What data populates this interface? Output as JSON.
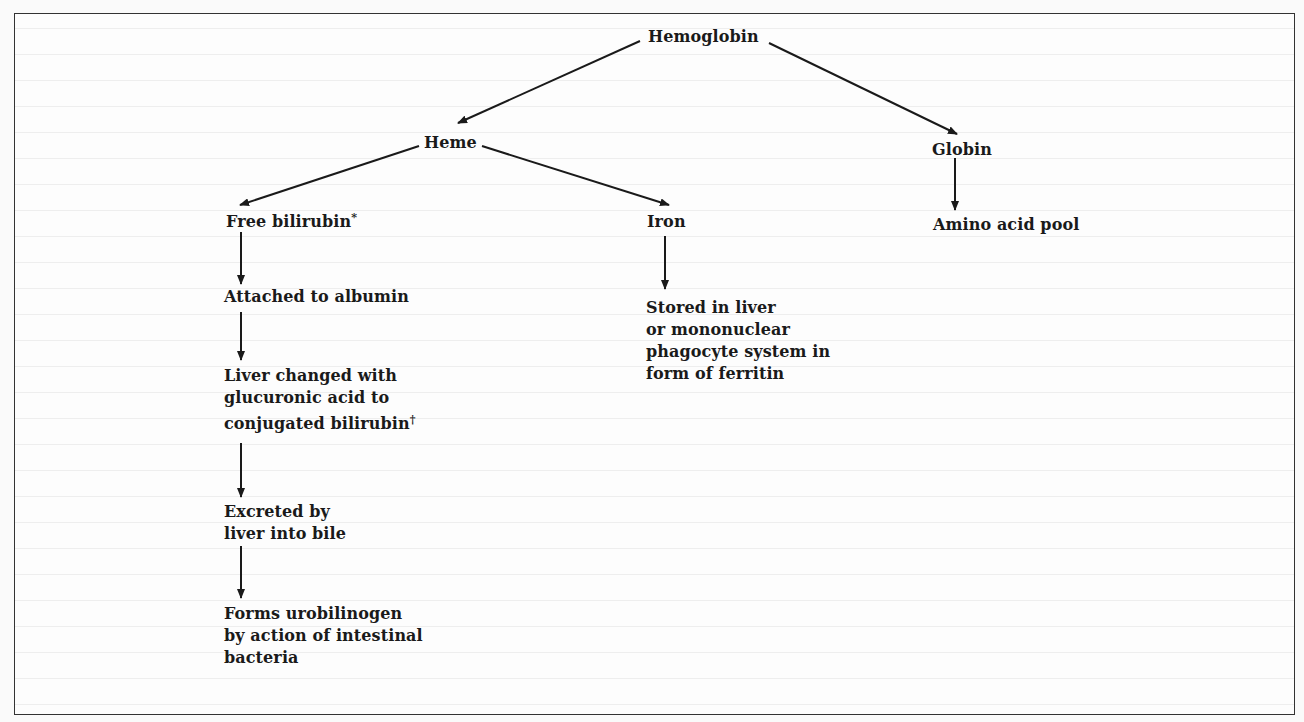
{
  "diagram": {
    "type": "flowchart",
    "nodes": {
      "hemoglobin": "Hemoglobin",
      "heme": "Heme",
      "globin": "Globin",
      "free_bilirubin": "Free bilirubin",
      "free_bilirubin_mark": "*",
      "iron": "Iron",
      "amino_acid_pool": "Amino acid pool",
      "attached_albumin": "Attached to albumin",
      "liver_changed": [
        "Liver changed with",
        "glucuronic acid to",
        "conjugated bilirubin"
      ],
      "liver_changed_mark": "†",
      "stored_liver": [
        "Stored in liver",
        "or mononuclear",
        "phagocyte system in",
        "form of ferritin"
      ],
      "excreted": [
        "Excreted by",
        "liver into bile"
      ],
      "urobilinogen": [
        "Forms urobilinogen",
        "by action of intestinal",
        "bacteria"
      ]
    },
    "edges": [
      [
        "Hemoglobin",
        "Heme"
      ],
      [
        "Hemoglobin",
        "Globin"
      ],
      [
        "Heme",
        "Free bilirubin"
      ],
      [
        "Heme",
        "Iron"
      ],
      [
        "Globin",
        "Amino acid pool"
      ],
      [
        "Free bilirubin",
        "Attached to albumin"
      ],
      [
        "Attached to albumin",
        "Liver changed with glucuronic acid to conjugated bilirubin"
      ],
      [
        "Liver changed with glucuronic acid to conjugated bilirubin",
        "Excreted by liver into bile"
      ],
      [
        "Excreted by liver into bile",
        "Forms urobilinogen by action of intestinal bacteria"
      ],
      [
        "Iron",
        "Stored in liver or mononuclear phagocyte system in form of ferritin"
      ]
    ],
    "colors": {
      "ink": "#1a1a1a",
      "paper": "#fdfdfd",
      "border": "#333333"
    }
  }
}
